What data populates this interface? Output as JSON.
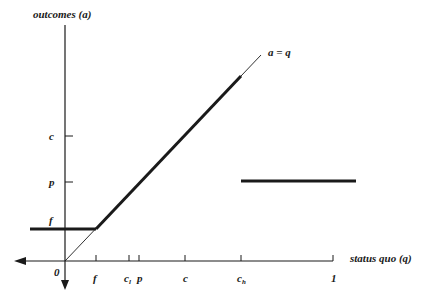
{
  "diagram": {
    "y_axis_label": "outcomes (a)",
    "x_axis_label": "status quo (q)",
    "diagonal_label": "a = q",
    "origin_label": "0",
    "x_ticks": [
      {
        "label": "f",
        "sub": ""
      },
      {
        "label": "c",
        "sub": "l"
      },
      {
        "label": "p",
        "sub": ""
      },
      {
        "label": "c",
        "sub": ""
      },
      {
        "label": "c",
        "sub": "h"
      },
      {
        "label": "1",
        "sub": ""
      }
    ],
    "y_ticks": [
      {
        "label": "c"
      },
      {
        "label": "p"
      },
      {
        "label": "f"
      }
    ],
    "colors": {
      "ink": "#1a1a1a",
      "background": "#ffffff"
    }
  }
}
